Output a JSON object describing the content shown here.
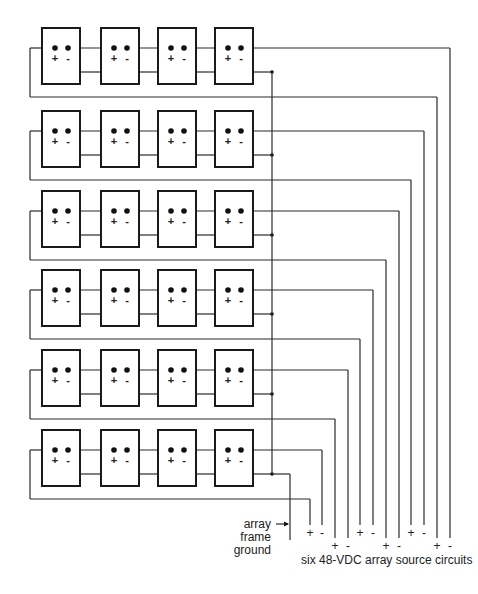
{
  "diagram": {
    "rows": 6,
    "modules_per_row": 4,
    "module_terminal_labels": {
      "positive": "+",
      "negative": "-"
    },
    "colors": {
      "line": "#2a2a2a",
      "background": "#ffffff"
    },
    "ground_label": [
      "array",
      "frame",
      "ground"
    ],
    "caption": "six 48-VDC array source circuits",
    "output_terminals": [
      {
        "circuit": 1,
        "plus": "+",
        "minus": "-"
      },
      {
        "circuit": 2,
        "plus": "+",
        "minus": "-"
      },
      {
        "circuit": 3,
        "plus": "+",
        "minus": "-"
      },
      {
        "circuit": 4,
        "plus": "+",
        "minus": "-"
      },
      {
        "circuit": 5,
        "plus": "+",
        "minus": "-"
      },
      {
        "circuit": 6,
        "plus": "+",
        "minus": "-"
      }
    ]
  }
}
